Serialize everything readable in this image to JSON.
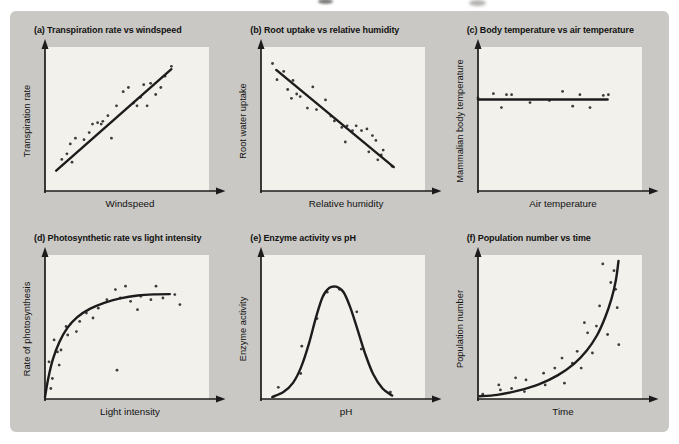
{
  "figure": {
    "colors": {
      "page_bg": "#ffffff",
      "sheet_bg": "#c9c8c4",
      "plot_bg": "#f2f1ec",
      "ink": "#1c1c1c",
      "dot": "#3c3c3c",
      "text": "#121212"
    }
  },
  "chart_data": [
    {
      "id": "a",
      "type": "scatter",
      "title": "(a) Transpiration rate vs windspeed",
      "xlabel": "Windspeed",
      "ylabel": "Transpiration rate",
      "relationship": "positive linear",
      "axis_ticks": "none (qualitative axes)",
      "trend": {
        "kind": "line",
        "points": [
          [
            0.07,
            0.13
          ],
          [
            0.79,
            0.85
          ]
        ]
      },
      "points": [
        [
          0.105,
          0.21
        ],
        [
          0.137,
          0.25
        ],
        [
          0.158,
          0.32
        ],
        [
          0.169,
          0.19
        ],
        [
          0.19,
          0.36
        ],
        [
          0.244,
          0.35
        ],
        [
          0.276,
          0.4
        ],
        [
          0.297,
          0.46
        ],
        [
          0.329,
          0.47
        ],
        [
          0.351,
          0.46
        ],
        [
          0.361,
          0.48
        ],
        [
          0.393,
          0.52
        ],
        [
          0.415,
          0.36
        ],
        [
          0.447,
          0.59
        ],
        [
          0.489,
          0.69
        ],
        [
          0.521,
          0.72
        ],
        [
          0.553,
          0.61
        ],
        [
          0.575,
          0.59
        ],
        [
          0.596,
          0.65
        ],
        [
          0.617,
          0.74
        ],
        [
          0.638,
          0.59
        ],
        [
          0.66,
          0.75
        ],
        [
          0.692,
          0.67
        ],
        [
          0.724,
          0.72
        ],
        [
          0.75,
          0.8
        ],
        [
          0.79,
          0.87
        ]
      ]
    },
    {
      "id": "b",
      "type": "scatter",
      "title": "(b) Root uptake vs relative humidity",
      "xlabel": "Relative humidity",
      "ylabel": "Root water uptake",
      "relationship": "negative linear",
      "axis_ticks": "none (qualitative axes)",
      "trend": {
        "kind": "line",
        "points": [
          [
            0.095,
            0.845
          ],
          [
            0.83,
            0.155
          ]
        ]
      },
      "points": [
        [
          0.072,
          0.89
        ],
        [
          0.1,
          0.775
        ],
        [
          0.142,
          0.834
        ],
        [
          0.167,
          0.706
        ],
        [
          0.19,
          0.643
        ],
        [
          0.2,
          0.77
        ],
        [
          0.223,
          0.674
        ],
        [
          0.245,
          0.655
        ],
        [
          0.29,
          0.574
        ],
        [
          0.324,
          0.724
        ],
        [
          0.347,
          0.563
        ],
        [
          0.403,
          0.632
        ],
        [
          0.437,
          0.517
        ],
        [
          0.459,
          0.483
        ],
        [
          0.505,
          0.437
        ],
        [
          0.527,
          0.333
        ],
        [
          0.538,
          0.448
        ],
        [
          0.572,
          0.414
        ],
        [
          0.595,
          0.448
        ],
        [
          0.628,
          0.414
        ],
        [
          0.662,
          0.426
        ],
        [
          0.674,
          0.264
        ],
        [
          0.696,
          0.379
        ],
        [
          0.718,
          0.345
        ],
        [
          0.73,
          0.207
        ],
        [
          0.752,
          0.241
        ],
        [
          0.764,
          0.276
        ],
        [
          0.82,
          0.161
        ]
      ]
    },
    {
      "id": "c",
      "type": "scatter",
      "title": "(c) Body temperature vs air temperature",
      "xlabel": "Air temperature",
      "ylabel": "Mammalian body temperature",
      "relationship": "constant (no change)",
      "axis_ticks": "none (qualitative axes)",
      "trend": {
        "kind": "line",
        "points": [
          [
            0.0,
            0.635
          ],
          [
            0.81,
            0.635
          ]
        ]
      },
      "points": [
        [
          0.0,
          0.646
        ],
        [
          0.096,
          0.676
        ],
        [
          0.146,
          0.577
        ],
        [
          0.178,
          0.669
        ],
        [
          0.21,
          0.669
        ],
        [
          0.325,
          0.613
        ],
        [
          0.446,
          0.627
        ],
        [
          0.529,
          0.692
        ],
        [
          0.592,
          0.587
        ],
        [
          0.637,
          0.669
        ],
        [
          0.7,
          0.577
        ],
        [
          0.783,
          0.664
        ],
        [
          0.815,
          0.669
        ]
      ]
    },
    {
      "id": "d",
      "type": "scatter",
      "title": "(d) Photosynthetic rate vs light intensity",
      "xlabel": "Light intensity",
      "ylabel": "Rate of photosynthesis",
      "relationship": "saturating rise to plateau",
      "axis_ticks": "none (qualitative axes)",
      "trend": {
        "kind": "curve",
        "points": [
          [
            0.0,
            0.0
          ],
          [
            0.02,
            0.13
          ],
          [
            0.05,
            0.27
          ],
          [
            0.09,
            0.39
          ],
          [
            0.14,
            0.49
          ],
          [
            0.2,
            0.565
          ],
          [
            0.28,
            0.625
          ],
          [
            0.37,
            0.668
          ],
          [
            0.47,
            0.7
          ],
          [
            0.58,
            0.72
          ],
          [
            0.68,
            0.728
          ],
          [
            0.78,
            0.73
          ]
        ]
      },
      "points": [
        [
          0.025,
          0.25
        ],
        [
          0.036,
          0.06
        ],
        [
          0.046,
          0.131
        ],
        [
          0.057,
          0.405
        ],
        [
          0.078,
          0.32
        ],
        [
          0.089,
          0.226
        ],
        [
          0.1,
          0.333
        ],
        [
          0.132,
          0.5
        ],
        [
          0.142,
          0.44
        ],
        [
          0.196,
          0.464
        ],
        [
          0.217,
          0.536
        ],
        [
          0.259,
          0.595
        ],
        [
          0.3,
          0.56
        ],
        [
          0.333,
          0.63
        ],
        [
          0.387,
          0.69
        ],
        [
          0.44,
          0.762
        ],
        [
          0.45,
          0.19
        ],
        [
          0.471,
          0.702
        ],
        [
          0.503,
          0.786
        ],
        [
          0.535,
          0.679
        ],
        [
          0.578,
          0.619
        ],
        [
          0.599,
          0.714
        ],
        [
          0.662,
          0.69
        ],
        [
          0.694,
          0.786
        ],
        [
          0.737,
          0.702
        ],
        [
          0.811,
          0.726
        ],
        [
          0.843,
          0.655
        ]
      ]
    },
    {
      "id": "e",
      "type": "scatter",
      "title": "(e) Enzyme activity vs pH",
      "xlabel": "pH",
      "ylabel": "Enzyme activity",
      "relationship": "bell-shaped optimum curve",
      "axis_ticks": "none (qualitative axes)",
      "trend": {
        "kind": "curve",
        "points": [
          [
            0.07,
            0.0
          ],
          [
            0.14,
            0.035
          ],
          [
            0.2,
            0.1
          ],
          [
            0.25,
            0.21
          ],
          [
            0.3,
            0.38
          ],
          [
            0.345,
            0.57
          ],
          [
            0.385,
            0.71
          ],
          [
            0.425,
            0.772
          ],
          [
            0.47,
            0.782
          ],
          [
            0.515,
            0.745
          ],
          [
            0.555,
            0.645
          ],
          [
            0.6,
            0.49
          ],
          [
            0.65,
            0.31
          ],
          [
            0.7,
            0.165
          ],
          [
            0.76,
            0.06
          ],
          [
            0.82,
            0.01
          ]
        ]
      },
      "points": [
        [
          0.108,
          0.069
        ],
        [
          0.248,
          0.167
        ],
        [
          0.255,
          0.36
        ],
        [
          0.35,
          0.556
        ],
        [
          0.414,
          0.743
        ],
        [
          0.49,
          0.764
        ],
        [
          0.599,
          0.604
        ],
        [
          0.627,
          0.34
        ],
        [
          0.809,
          0.035
        ]
      ]
    },
    {
      "id": "f",
      "type": "scatter",
      "title": "(f) Population number vs time",
      "xlabel": "Time",
      "ylabel": "Population number",
      "relationship": "exponential growth",
      "axis_ticks": "none (qualitative axes)",
      "trend": {
        "kind": "curve",
        "points": [
          [
            0.01,
            0.005
          ],
          [
            0.12,
            0.015
          ],
          [
            0.25,
            0.045
          ],
          [
            0.38,
            0.09
          ],
          [
            0.5,
            0.155
          ],
          [
            0.6,
            0.235
          ],
          [
            0.68,
            0.33
          ],
          [
            0.745,
            0.44
          ],
          [
            0.795,
            0.565
          ],
          [
            0.835,
            0.7
          ],
          [
            0.862,
            0.83
          ],
          [
            0.878,
            0.965
          ]
        ]
      },
      "points": [
        [
          0.03,
          0.02
        ],
        [
          0.13,
          0.086
        ],
        [
          0.14,
          0.05
        ],
        [
          0.21,
          0.06
        ],
        [
          0.235,
          0.136
        ],
        [
          0.29,
          0.038
        ],
        [
          0.3,
          0.121
        ],
        [
          0.41,
          0.169
        ],
        [
          0.42,
          0.086
        ],
        [
          0.48,
          0.205
        ],
        [
          0.525,
          0.276
        ],
        [
          0.54,
          0.098
        ],
        [
          0.59,
          0.24
        ],
        [
          0.62,
          0.324
        ],
        [
          0.645,
          0.205
        ],
        [
          0.665,
          0.527
        ],
        [
          0.685,
          0.455
        ],
        [
          0.715,
          0.312
        ],
        [
          0.74,
          0.503
        ],
        [
          0.76,
          0.646
        ],
        [
          0.78,
          0.944
        ],
        [
          0.81,
          0.443
        ],
        [
          0.83,
          0.812
        ],
        [
          0.85,
          0.896
        ],
        [
          0.86,
          0.764
        ],
        [
          0.87,
          0.633
        ],
        [
          0.88,
          0.371
        ]
      ]
    }
  ]
}
